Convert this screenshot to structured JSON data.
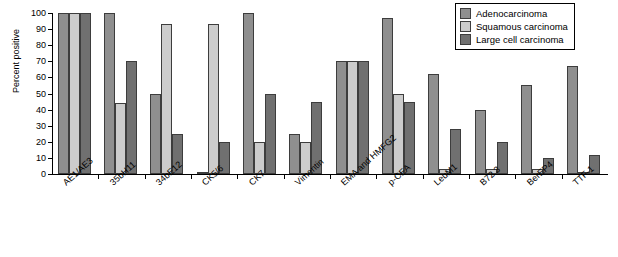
{
  "chart_data": {
    "type": "bar",
    "title": "",
    "xlabel": "",
    "ylabel": "Percent positive",
    "ylim": [
      0,
      100
    ],
    "yticks": [
      0,
      10,
      20,
      30,
      40,
      50,
      60,
      70,
      80,
      90,
      100
    ],
    "grid": false,
    "legend_position": "top-right",
    "categories": [
      "AE1/AE3",
      "35bH11",
      "34bE12",
      "CK5/6",
      "CK7",
      "Vimentin",
      "EMA and HMFG2",
      "p-CEA",
      "LeuM1",
      "B72.3",
      "BerEP4",
      "TTF-1"
    ],
    "series": [
      {
        "name": "Adenocarcinoma",
        "color": "#8f8f8f",
        "values": [
          100,
          100,
          50,
          1,
          100,
          25,
          70,
          97,
          62,
          40,
          55,
          67
        ]
      },
      {
        "name": "Squamous carcinoma",
        "color": "#cccccc",
        "values": [
          100,
          44,
          93,
          93,
          20,
          20,
          70,
          50,
          3,
          3,
          3,
          1
        ]
      },
      {
        "name": "Large cell carcinoma",
        "color": "#707070",
        "values": [
          100,
          70,
          25,
          20,
          50,
          45,
          70,
          45,
          28,
          20,
          10,
          12
        ]
      }
    ]
  }
}
